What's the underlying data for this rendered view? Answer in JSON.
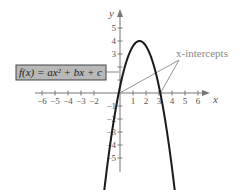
{
  "chart_data": {
    "type": "line",
    "title": "",
    "function_label": "f(x) = ax² + bx + c",
    "annotation": "x-intercepts",
    "xlabel": "x",
    "ylabel": "y",
    "xlim": [
      -6.5,
      7
    ],
    "ylim": [
      -6,
      5.8
    ],
    "grid": false,
    "x_ticks": [
      -6,
      -5,
      -4,
      -3,
      -2,
      1,
      2,
      3,
      4,
      5,
      6
    ],
    "x_tick_labels": [
      "−6",
      "−5",
      "−4",
      "−3",
      "−2",
      "1",
      "2",
      "3",
      "4",
      "5",
      "6"
    ],
    "y_ticks": [
      5,
      4,
      3,
      2,
      1,
      -1,
      -2,
      -3,
      -4,
      -5
    ],
    "y_tick_labels": [
      "5",
      "4",
      "3",
      "",
      "",
      "−1",
      "−2",
      "−3",
      "−4",
      "−5"
    ],
    "series": [
      {
        "name": "f(x)",
        "description": "downward-opening parabola",
        "vertex": [
          1.5,
          4
        ],
        "x_intercepts": [
          -0.1,
          3.1
        ],
        "x": [
          -1.7,
          -1.0,
          -0.5,
          -0.1,
          0.5,
          1.0,
          1.5,
          2.0,
          2.5,
          3.1,
          3.5,
          4.0,
          4.7
        ],
        "y": [
          -5.8,
          -2.2,
          -0.4,
          0,
          2.3,
          3.6,
          4,
          3.6,
          2.3,
          0,
          -1.4,
          -3.4,
          -5.8
        ]
      }
    ],
    "colors": {
      "curve": "#1a1a1a",
      "axis": "#777777",
      "box_fill": "#b8b8b8",
      "box_border": "#444444",
      "annotation": "#888888"
    }
  }
}
